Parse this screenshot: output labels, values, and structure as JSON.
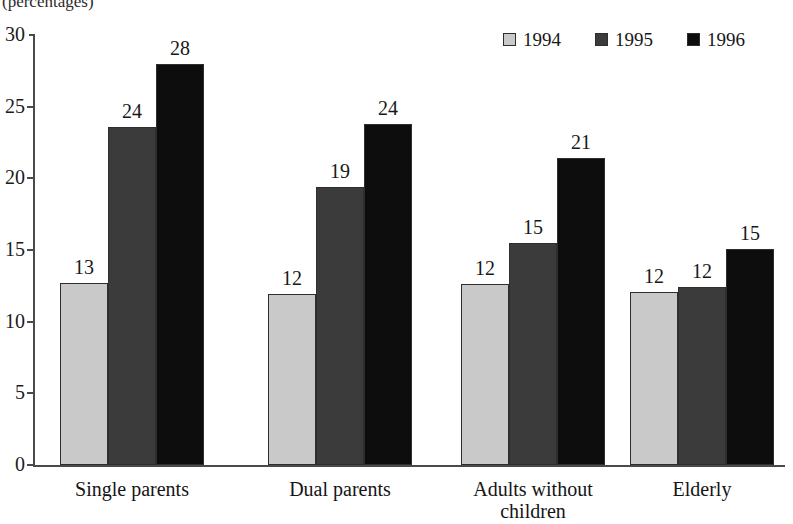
{
  "caption": "(percentages)",
  "legend": {
    "position": "top-right",
    "entries": [
      {
        "label": "1994",
        "color": "#c9c9c9",
        "swatch_name": "legend-swatch-1994"
      },
      {
        "label": "1995",
        "color": "#3b3b3b",
        "swatch_name": "legend-swatch-1995"
      },
      {
        "label": "1996",
        "color": "#0d0d0d",
        "swatch_name": "legend-swatch-1996"
      }
    ]
  },
  "yaxis": {
    "ticks": [
      "0",
      "5",
      "10",
      "15",
      "20",
      "25",
      "30"
    ],
    "min": 0,
    "max": 30,
    "step": 5
  },
  "categories": [
    {
      "line1": "Single parents",
      "line2": ""
    },
    {
      "line1": "Dual parents",
      "line2": ""
    },
    {
      "line1": "Adults without",
      "line2": "children"
    },
    {
      "line1": "Elderly",
      "line2": ""
    }
  ],
  "bars": [
    {
      "group": 0,
      "series": "1994",
      "label": "13",
      "value": 12.7
    },
    {
      "group": 0,
      "series": "1995",
      "label": "24",
      "value": 23.6
    },
    {
      "group": 0,
      "series": "1996",
      "label": "28",
      "value": 28.0
    },
    {
      "group": 1,
      "series": "1994",
      "label": "12",
      "value": 11.9
    },
    {
      "group": 1,
      "series": "1995",
      "label": "19",
      "value": 19.4
    },
    {
      "group": 1,
      "series": "1996",
      "label": "24",
      "value": 23.8
    },
    {
      "group": 2,
      "series": "1994",
      "label": "12",
      "value": 12.6
    },
    {
      "group": 2,
      "series": "1995",
      "label": "15",
      "value": 15.5
    },
    {
      "group": 2,
      "series": "1996",
      "label": "21",
      "value": 21.4
    },
    {
      "group": 3,
      "series": "1994",
      "label": "12",
      "value": 12.1
    },
    {
      "group": 3,
      "series": "1995",
      "label": "12",
      "value": 12.4
    },
    {
      "group": 3,
      "series": "1996",
      "label": "15",
      "value": 15.1
    }
  ],
  "chart_data": {
    "type": "bar",
    "title": "",
    "subtitle": "(percentages)",
    "xlabel": "",
    "ylabel": "",
    "ylim": [
      0,
      30
    ],
    "ytick_step": 5,
    "grid": false,
    "legend_position": "top-right",
    "categories": [
      "Single parents",
      "Dual parents",
      "Adults without children",
      "Elderly"
    ],
    "series": [
      {
        "name": "1994",
        "color": "#c9c9c9",
        "values": [
          13,
          12,
          12,
          12
        ],
        "plotted_values": [
          12.7,
          11.9,
          12.6,
          12.1
        ]
      },
      {
        "name": "1995",
        "color": "#3b3b3b",
        "values": [
          24,
          19,
          15,
          12
        ],
        "plotted_values": [
          23.6,
          19.4,
          15.5,
          12.4
        ]
      },
      {
        "name": "1996",
        "color": "#0d0d0d",
        "values": [
          28,
          24,
          21,
          15
        ],
        "plotted_values": [
          28.0,
          23.8,
          21.4,
          15.1
        ]
      }
    ],
    "data_labels": [
      [
        "13",
        "24",
        "28"
      ],
      [
        "12",
        "19",
        "24"
      ],
      [
        "12",
        "15",
        "21"
      ],
      [
        "12",
        "12",
        "15"
      ]
    ]
  }
}
